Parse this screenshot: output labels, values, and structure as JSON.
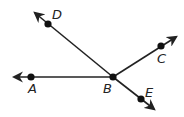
{
  "diagram": {
    "type": "geometry-rays",
    "vertex": "B",
    "points": [
      {
        "id": "A",
        "label": "A",
        "x": 31,
        "y": 77,
        "lx": 28,
        "ly": 93
      },
      {
        "id": "B",
        "label": "B",
        "x": 113,
        "y": 77,
        "lx": 103,
        "ly": 93
      },
      {
        "id": "C",
        "label": "C",
        "x": 161,
        "y": 46,
        "lx": 157,
        "ly": 63
      },
      {
        "id": "D",
        "label": "D",
        "x": 48,
        "y": 24,
        "lx": 52,
        "ly": 19
      },
      {
        "id": "E",
        "label": "E",
        "x": 141,
        "y": 99,
        "lx": 145,
        "ly": 97
      }
    ],
    "rays": [
      {
        "name": "ray-BA",
        "from": "B",
        "through": "A",
        "tip": [
          14,
          77
        ]
      },
      {
        "name": "ray-BD",
        "from": "B",
        "through": "D",
        "tip": [
          35,
          13
        ]
      },
      {
        "name": "ray-BC",
        "from": "B",
        "through": "C",
        "tip": [
          176,
          37
        ]
      },
      {
        "name": "ray-BE",
        "from": "B",
        "through": "E",
        "tip": [
          154,
          109
        ]
      }
    ],
    "colors": {
      "line": "#222222",
      "point": "#111111"
    }
  }
}
